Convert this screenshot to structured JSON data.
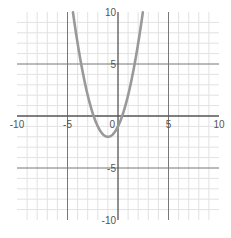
{
  "chart_data": {
    "type": "line",
    "title": "",
    "xlabel": "",
    "ylabel": "",
    "xlim": [
      -10,
      10
    ],
    "ylim": [
      -10,
      10
    ],
    "grid": true,
    "minor_grid_step": 1,
    "major_grid_step": 5,
    "x_tick_labels": [
      {
        "value": -10,
        "label": "-10"
      },
      {
        "value": -5,
        "label": "-5"
      },
      {
        "value": 0,
        "label": "0"
      },
      {
        "value": 5,
        "label": "5"
      },
      {
        "value": 10,
        "label": "10"
      }
    ],
    "y_tick_labels": [
      {
        "value": 10,
        "label": "10"
      },
      {
        "value": 5,
        "label": "5"
      },
      {
        "value": -5,
        "label": "-5"
      },
      {
        "value": -10,
        "label": "-10"
      }
    ],
    "series": [
      {
        "name": "y = x^2 + 2x - 1",
        "function": "x^2 + 2x - 1",
        "color": "#999999",
        "x": [
          -4.46,
          -4,
          -3.5,
          -3,
          -2.5,
          -2,
          -1.5,
          -1,
          -0.5,
          0,
          0.5,
          1,
          1.5,
          2,
          2.46
        ],
        "y": [
          10,
          7,
          4.25,
          2,
          0.25,
          -1,
          -1.75,
          -2,
          -1.75,
          -1,
          0.25,
          2,
          4.25,
          7,
          10
        ]
      }
    ],
    "colors": {
      "minor_grid": "#e2e2e2",
      "major_grid": "#777777",
      "axis": "#555555"
    }
  }
}
